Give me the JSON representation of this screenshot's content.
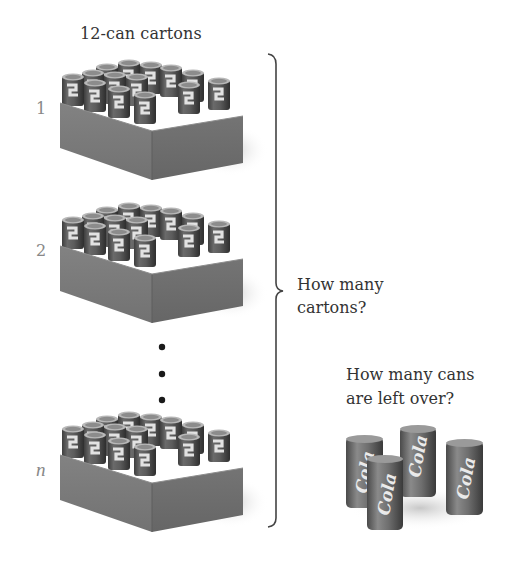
{
  "figure": {
    "title": "12-can cartons",
    "cartons": [
      {
        "label": "1",
        "offset_y": 0
      },
      {
        "label": "2",
        "offset_y": 143
      },
      {
        "label": "n",
        "offset_y": 352
      }
    ],
    "ellipsis_dots": 3,
    "brace_question": {
      "line1": "How many",
      "line2": "cartons?"
    },
    "leftover_question": {
      "line1": "How many cans",
      "line2": "are left over?"
    },
    "leftover_cans": {
      "count": 4,
      "can_text": "Cola"
    },
    "cans_per_carton": 12
  },
  "colors": {
    "carton_front": "#7a7a7a",
    "carton_side": "#6b6b6b",
    "can_body": "#5a5a5a",
    "can_highlight": "#d8d8d8",
    "brace": "#444444",
    "dots": "#1a1a1a",
    "label_gray": "#888888"
  }
}
